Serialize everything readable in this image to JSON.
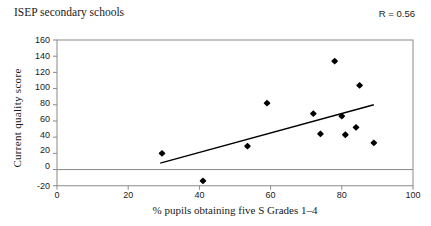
{
  "chart_data": {
    "type": "scatter",
    "title": "ISEP secondary schools",
    "annotation": "R = 0.56",
    "xlabel": "% pupils obtaining five S Grades 1–4",
    "ylabel": "Current  quality  score",
    "xlim": [
      0,
      100
    ],
    "ylim": [
      -20,
      160
    ],
    "xticks": [
      0,
      20,
      40,
      60,
      80,
      100
    ],
    "yticks": [
      -20,
      0,
      20,
      40,
      60,
      80,
      100,
      120,
      140,
      160
    ],
    "xtick_labels": [
      "0",
      "20",
      "40",
      "60",
      "80",
      "100"
    ],
    "ytick_labels": [
      "-20",
      "0",
      "20",
      "40",
      "60",
      "80",
      "100",
      "120",
      "140",
      "160"
    ],
    "grid": false,
    "zero_line": true,
    "legend": "none",
    "marker": "diamond",
    "marker_color": "#000000",
    "series": [
      {
        "name": "ISEP secondary schools",
        "points": [
          {
            "x": 29.5,
            "y": 20
          },
          {
            "x": 41.0,
            "y": -14
          },
          {
            "x": 53.5,
            "y": 29
          },
          {
            "x": 59.0,
            "y": 82
          },
          {
            "x": 72.0,
            "y": 69
          },
          {
            "x": 74.0,
            "y": 44
          },
          {
            "x": 78.0,
            "y": 134
          },
          {
            "x": 80.0,
            "y": 66
          },
          {
            "x": 81.0,
            "y": 43
          },
          {
            "x": 84.0,
            "y": 52
          },
          {
            "x": 85.0,
            "y": 104
          },
          {
            "x": 89.0,
            "y": 33
          }
        ]
      }
    ],
    "trendline": {
      "x0": 29.0,
      "y0": 8,
      "x1": 89.0,
      "y1": 80,
      "color": "#000000"
    }
  }
}
